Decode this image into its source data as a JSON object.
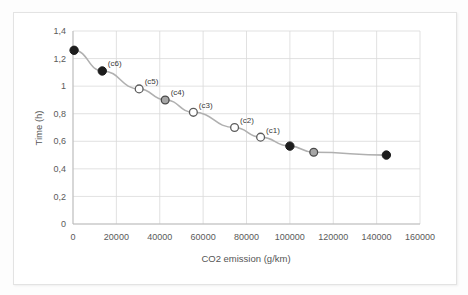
{
  "chart_data": {
    "type": "scatter",
    "title": "",
    "xlabel": "CO2 emission (g/km)",
    "ylabel": "Time (h)",
    "xlim": [
      0,
      160000
    ],
    "ylim": [
      0,
      1.4
    ],
    "grid": true,
    "legend": "none",
    "decimal_separator": ",",
    "xticks": [
      "0",
      "20000",
      "40000",
      "60000",
      "80000",
      "100000",
      "120000",
      "140000",
      "160000"
    ],
    "xtick_values": [
      0,
      20000,
      40000,
      60000,
      80000,
      100000,
      120000,
      140000,
      160000
    ],
    "yticks": [
      "0",
      "0,2",
      "0,4",
      "0,6",
      "0,8",
      "1",
      "1,2",
      "1,4"
    ],
    "ytick_values": [
      0,
      0.2,
      0.4,
      0.6,
      0.8,
      1.0,
      1.2,
      1.4
    ],
    "series": [
      {
        "name": "Pareto front",
        "points": [
          {
            "x": 500,
            "y": 1.26,
            "marker": "filled",
            "label": ""
          },
          {
            "x": 13500,
            "y": 1.11,
            "marker": "filled",
            "label": "(c6)"
          },
          {
            "x": 30500,
            "y": 0.98,
            "marker": "open",
            "label": "(c5)"
          },
          {
            "x": 42500,
            "y": 0.9,
            "marker": "gray",
            "label": "(c4)"
          },
          {
            "x": 55500,
            "y": 0.81,
            "marker": "open",
            "label": "(c3)"
          },
          {
            "x": 74500,
            "y": 0.7,
            "marker": "open",
            "label": "(c2)"
          },
          {
            "x": 86500,
            "y": 0.63,
            "marker": "open",
            "label": "(c1)"
          },
          {
            "x": 100000,
            "y": 0.565,
            "marker": "filled",
            "label": ""
          },
          {
            "x": 111000,
            "y": 0.52,
            "marker": "gray",
            "label": ""
          },
          {
            "x": 144500,
            "y": 0.5,
            "marker": "filled",
            "label": ""
          }
        ]
      }
    ],
    "colors": {
      "line": "#b0b0b0",
      "marker_filled": "#1d1d1d",
      "marker_open_stroke": "#5c5c5c",
      "marker_gray": "#a6a6a6",
      "grid": "#d9d9d9",
      "axis": "#b8b8b8",
      "text": "#5a5a5a"
    }
  }
}
